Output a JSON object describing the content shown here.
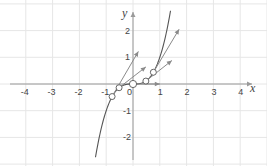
{
  "chart_data": {
    "type": "line",
    "title": "",
    "xlabel": "x",
    "ylabel": "y",
    "xlim": [
      -4.6,
      4.7
    ],
    "ylim": [
      -2.9,
      3.1
    ],
    "grid": true,
    "x_ticks": [
      -4,
      -3,
      -2,
      -1,
      0,
      1,
      2,
      3,
      4
    ],
    "y_ticks": [
      -2,
      -1,
      1,
      2
    ],
    "x_tick_labels": [
      "-4",
      "-3",
      "-2",
      "-1",
      "0",
      "1",
      "2",
      "3",
      "4"
    ],
    "y_tick_labels": [
      "-2",
      "-1",
      "1",
      "2"
    ],
    "series": [
      {
        "name": "curve y = x^3",
        "function": "x^3",
        "x_range": [
          -1.4,
          1.4
        ],
        "color": "#555555"
      }
    ],
    "points": [
      {
        "x": -0.78,
        "y": -0.47
      },
      {
        "x": -0.52,
        "y": -0.14
      },
      {
        "x": 0,
        "y": 0
      },
      {
        "x": 0.48,
        "y": 0.11
      },
      {
        "x": 0.76,
        "y": 0.44
      }
    ],
    "tangent_vectors": [
      {
        "from": [
          -0.78,
          -0.47
        ],
        "to": [
          0.2,
          1.22
        ]
      },
      {
        "from": [
          -0.52,
          -0.14
        ],
        "to": [
          0.48,
          0.64
        ]
      },
      {
        "from": [
          0,
          0
        ],
        "to": [
          1.0,
          0
        ]
      },
      {
        "from": [
          0.48,
          0.11
        ],
        "to": [
          1.45,
          0.88
        ]
      },
      {
        "from": [
          0.76,
          0.44
        ],
        "to": [
          1.72,
          2.05
        ]
      }
    ],
    "colors": {
      "curve": "#555555",
      "vectors": "#8a8a8a",
      "grid": "#e6e6e6",
      "axes": "#9a9a9a",
      "points_fill": "#ffffff",
      "points_stroke": "#666666"
    }
  },
  "axes": {
    "x_label": "x",
    "y_label": "y"
  }
}
